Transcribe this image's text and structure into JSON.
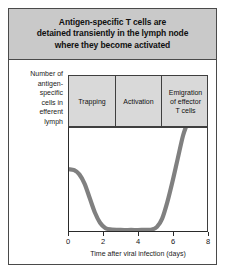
{
  "figure": {
    "title_lines": [
      "Antigen-specific T cells are",
      "detained transiently in the lymph node",
      "where they become activated"
    ],
    "y_axis_label_lines": [
      "Number of",
      "antigen-",
      "specific",
      "cells in",
      "efferent",
      "lymph"
    ],
    "phases": [
      {
        "lines": [
          "Trapping"
        ]
      },
      {
        "lines": [
          "Activation"
        ]
      },
      {
        "lines": [
          "Emigration",
          "of effector",
          "T cells"
        ]
      }
    ],
    "colors": {
      "title_background": "#c9c9c9",
      "phase_background": "#d9d9d9",
      "curve": "#808080",
      "frame": "#4a4a4a",
      "axis": "#2a2a2a",
      "plot_background": "#ffffff"
    }
  },
  "chart_data": {
    "type": "line",
    "title": "Antigen-specific T cells are detained transiently in the lymph node where they become activated",
    "xlabel": "Time after viral infection (days)",
    "ylabel": "Number of antigen-specific cells in efferent lymph",
    "xlim": [
      0,
      8
    ],
    "ylim": [
      0,
      1
    ],
    "xticks": [
      0,
      2,
      4,
      6,
      8
    ],
    "xtick_labels": [
      "0",
      "2",
      "4",
      "6",
      "8"
    ],
    "yticks": [],
    "ytick_labels": [],
    "grid": false,
    "legend": null,
    "series": [
      {
        "name": "Antigen-specific cells in efferent lymph",
        "x": [
          0.0,
          0.3,
          0.6,
          0.9,
          1.2,
          1.5,
          1.8,
          2.1,
          2.4,
          3.0,
          3.6,
          4.2,
          4.8,
          5.1,
          5.4,
          5.7,
          6.0,
          6.3,
          6.6,
          6.8
        ],
        "y": [
          0.6,
          0.59,
          0.55,
          0.46,
          0.32,
          0.18,
          0.08,
          0.03,
          0.015,
          0.01,
          0.01,
          0.01,
          0.015,
          0.04,
          0.12,
          0.28,
          0.48,
          0.7,
          0.92,
          1.02
        ]
      }
    ],
    "annotations": [
      {
        "label": "Trapping",
        "x_range": [
          0,
          2.75
        ]
      },
      {
        "label": "Activation",
        "x_range": [
          2.75,
          5.4
        ]
      },
      {
        "label": "Emigration of effector T cells",
        "x_range": [
          5.4,
          8
        ]
      }
    ]
  }
}
